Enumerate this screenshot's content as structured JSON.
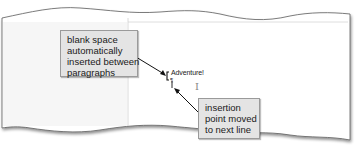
{
  "document": {
    "text_line": "Adventure!",
    "paragraph_mark": "¶",
    "cursor_glyph": "I"
  },
  "callouts": [
    {
      "id": "blank-space",
      "lines": [
        "blank space",
        "automatically",
        "inserted between",
        "paragraphs"
      ]
    },
    {
      "id": "insertion-point",
      "lines": [
        "insertion",
        "point moved",
        "to next line"
      ]
    }
  ],
  "colors": {
    "callout_fill": "#e4e4e4",
    "callout_border": "#9a9a9a",
    "paper_edge": "#666666",
    "arrow": "#111111"
  }
}
